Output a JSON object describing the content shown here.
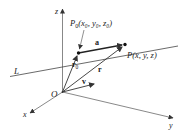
{
  "diagram": {
    "type": "vector-line-in-3d",
    "axes": {
      "x_label": "x",
      "y_label": "y",
      "z_label": "z",
      "origin_label": "O"
    },
    "line": {
      "label": "L"
    },
    "points": {
      "p0": {
        "name": "P",
        "sub": "0",
        "coords_text": "(x₀, y₀, z₀)"
      },
      "p": {
        "name": "P",
        "coords_text": "(x, y, z)"
      }
    },
    "vectors": {
      "a": {
        "label": "a"
      },
      "r0": {
        "label": "r",
        "sub": "0"
      },
      "r": {
        "label": "r"
      },
      "v": {
        "label": "v"
      }
    },
    "colors": {
      "stroke": "#333333",
      "text": "#222222",
      "background": "#ffffff"
    }
  }
}
